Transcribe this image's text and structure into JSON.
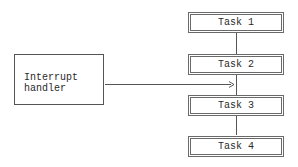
{
  "diagram": {
    "tasks": [
      {
        "label": "Task 1"
      },
      {
        "label": "Task 2"
      },
      {
        "label": "Task 3"
      },
      {
        "label": "Task 4"
      }
    ],
    "handler": {
      "line1": "Interrupt",
      "line2": "handler"
    },
    "edges": [
      {
        "from": "Task 1",
        "to": "Task 2",
        "type": "line"
      },
      {
        "from": "Task 2",
        "to": "Task 3",
        "type": "line"
      },
      {
        "from": "Task 3",
        "to": "Task 4",
        "type": "line"
      },
      {
        "from": "Interrupt handler",
        "to": "Task 2-Task 3 link",
        "type": "arrow"
      }
    ]
  }
}
